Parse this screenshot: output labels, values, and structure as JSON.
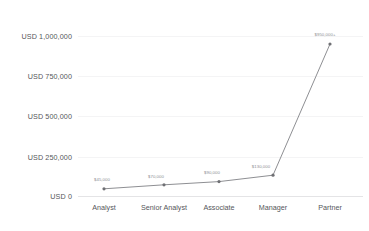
{
  "chart_data": {
    "type": "line",
    "title": "",
    "subtitle": "",
    "xlabel": "",
    "ylabel": "",
    "categories": [
      "Analyst",
      "Senior Analyst",
      "Associate",
      "Manager",
      "Partner"
    ],
    "values": [
      45000,
      70000,
      90000,
      130000,
      950000
    ],
    "point_labels": [
      "$45,000",
      "$70,000",
      "$90,000",
      "$130,000",
      "$950,000+"
    ],
    "ylim": [
      0,
      1000000
    ],
    "ytick_values": [
      0,
      250000,
      500000,
      750000,
      1000000
    ],
    "ytick_labels": [
      "USD 0",
      "USD 250,000",
      "USD 500,000",
      "USD 750,000",
      "USD 1,000,000"
    ],
    "grid": true,
    "legend": false,
    "legend_position": "none",
    "series": [
      {
        "name": "Compensation",
        "values": [
          45000,
          70000,
          90000,
          130000,
          950000
        ],
        "color": "#8e8f93",
        "marker": "circle"
      }
    ],
    "colors": {
      "line": "#8e8f93",
      "marker": "#6f7074",
      "gridline": "#f4f4f5",
      "axis": "#e4e4e6",
      "tick_text": "#55565a",
      "point_label_text": "#8c8d91",
      "background": "#ffffff"
    }
  }
}
